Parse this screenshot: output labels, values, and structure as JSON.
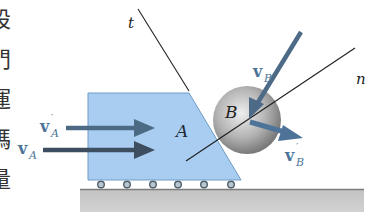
{
  "figure": {
    "side_text_chars": [
      "設",
      "門",
      "運",
      "碼",
      "量"
    ],
    "labels": {
      "t_axis": "t",
      "n_axis": "n",
      "block": "A",
      "sphere": "B",
      "vA_main": "v",
      "vA_sub": "A",
      "vA_prime_main": "v",
      "vA_prime_sub": "A",
      "vA_prime_mark": "′",
      "vB_main": "v",
      "vB_sub": "B",
      "vB_prime_main": "v",
      "vB_prime_sub": "B",
      "vB_prime_mark": "′"
    },
    "colors": {
      "block_fill": "#a9cdf0",
      "block_edge": "#6f9bc6",
      "arrow_dark": "#3c4e60",
      "arrow_light": "#4c6a84",
      "arrow_blue": "#4d7498",
      "sphere_light": "#e6e6e6",
      "sphere_dark": "#7a7a7a",
      "ground": "#c8c8c8",
      "ground_edge": "#8a8a8a",
      "line": "#222222",
      "label_blue": "#4d7498"
    }
  }
}
